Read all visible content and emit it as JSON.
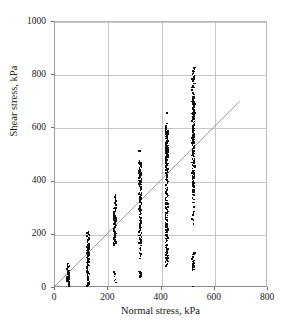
{
  "chart_data": {
    "type": "scatter",
    "title": "",
    "xlabel": "Normal stress, kPa",
    "ylabel": "Shear stress, kPa",
    "xlim": [
      0,
      800
    ],
    "ylim": [
      0,
      1000
    ],
    "xticks": [
      0,
      200,
      400,
      600,
      800
    ],
    "yticks": [
      0,
      200,
      400,
      600,
      800,
      1000
    ],
    "xtick_labels": [
      "0",
      "200",
      "400",
      "600",
      "800"
    ],
    "ytick_labels": [
      "0",
      "200",
      "400",
      "600",
      "800",
      "1000"
    ],
    "grid": true,
    "legend": false,
    "marker_color": "#111111",
    "grid_color": "#c6c6c6",
    "axis_color": "#8a8a8a",
    "trendline": {
      "name": "linear fit",
      "color": "#8e8e8e",
      "x_start": 0,
      "y_start": 0,
      "x_end": 700,
      "y_end": 700,
      "slope": 1.0,
      "intercept": 0
    },
    "series": [
      {
        "name": "Direct shear test results",
        "clusters": [
          {
            "x": 50,
            "y_min": 10,
            "y_max": 90,
            "values": [
              10,
              14,
              18,
              22,
              26,
              30,
              34,
              38,
              42,
              46,
              50,
              54,
              58,
              62,
              66,
              70,
              74,
              78,
              82,
              86,
              90,
              48,
              52,
              56,
              40,
              44,
              60,
              64,
              36,
              32
            ]
          },
          {
            "x": 125,
            "y_min": 5,
            "y_max": 212,
            "values": [
              5,
              12,
              20,
              28,
              35,
              42,
              50,
              58,
              65,
              72,
              80,
              88,
              95,
              100,
              105,
              110,
              115,
              120,
              124,
              128,
              132,
              136,
              140,
              144,
              148,
              152,
              156,
              160,
              164,
              168,
              172,
              176,
              180,
              184,
              188,
              192,
              196,
              200,
              204,
              208,
              212,
              130,
              134,
              138,
              142,
              146,
              150,
              154,
              158,
              162,
              118,
              122,
              126,
              112,
              108,
              102,
              96,
              90,
              84,
              76,
              68,
              60,
              54,
              46,
              38,
              30,
              22,
              16,
              10,
              8
            ]
          },
          {
            "x": 225,
            "y_min": 18,
            "y_max": 350,
            "values": [
              18,
              26,
              34,
              42,
              50,
              58,
              160,
              168,
              176,
              184,
              192,
              200,
              208,
              216,
              224,
              232,
              240,
              248,
              256,
              264,
              272,
              280,
              288,
              296,
              304,
              312,
              320,
              328,
              336,
              344,
              350,
              236,
              244,
              252,
              260,
              268,
              276,
              284,
              292,
              300,
              228,
              220,
              212,
              204,
              196,
              188,
              180,
              172,
              164,
              240,
              250,
              258,
              266,
              274,
              282,
              290,
              246,
              254,
              262,
              270
            ]
          },
          {
            "x": 320,
            "y_min": 38,
            "y_max": 515,
            "values": [
              38,
              44,
              50,
              56,
              62,
              120,
              150,
              170,
              185,
              195,
              205,
              215,
              225,
              235,
              245,
              255,
              265,
              275,
              285,
              295,
              305,
              315,
              325,
              335,
              345,
              355,
              365,
              375,
              385,
              390,
              395,
              400,
              405,
              410,
              415,
              420,
              425,
              430,
              435,
              440,
              445,
              450,
              455,
              460,
              465,
              470,
              478,
              515,
              398,
              402,
              406,
              412,
              418,
              424,
              408,
              414,
              422,
              428,
              434,
              396,
              392,
              388,
              380,
              370,
              360,
              350,
              340,
              330,
              320,
              310,
              300,
              290,
              280,
              270,
              260,
              250,
              240,
              230,
              220,
              210,
              200,
              190,
              180,
              168,
              158,
              140,
              130,
              110
            ]
          },
          {
            "x": 420,
            "y_min": 80,
            "y_max": 660,
            "values": [
              80,
              90,
              100,
              112,
              124,
              136,
              148,
              160,
              172,
              184,
              196,
              208,
              220,
              232,
              244,
              256,
              268,
              280,
              292,
              304,
              316,
              328,
              340,
              352,
              364,
              376,
              388,
              400,
              412,
              424,
              436,
              448,
              460,
              470,
              478,
              486,
              494,
              500,
              506,
              512,
              518,
              524,
              530,
              536,
              542,
              548,
              554,
              560,
              566,
              572,
              578,
              584,
              590,
              596,
              602,
              560,
              566,
              548,
              540,
              532,
              524,
              516,
              508,
              500,
              492,
              484,
              552,
              558,
              544,
              536,
              528,
              520,
              512,
              504,
              496,
              488,
              480,
              472,
              464,
              456,
              448,
              440,
              610,
              618,
              660,
              570,
              574,
              580,
              586,
              592,
              598,
              568,
              562,
              556,
              550,
              546,
              538,
              534,
              526,
              522,
              514,
              510,
              502,
              498,
              490,
              482,
              474,
              466,
              458,
              450,
              442,
              434,
              426,
              418,
              410,
              402,
              394,
              386,
              378,
              370,
              362,
              354,
              346,
              338,
              330,
              322,
              314,
              306,
              298,
              290,
              282,
              274,
              266,
              258,
              250,
              242,
              234,
              226,
              218,
              210,
              202,
              194,
              186,
              178,
              170,
              162,
              154,
              146,
              138,
              130,
              122,
              114,
              106,
              98,
              88
            ]
          },
          {
            "x": 520,
            "y_min": 5,
            "y_max": 830,
            "values": [
              5,
              70,
              78,
              86,
              94,
              102,
              110,
              118,
              126,
              132,
              92,
              84,
              76,
              240,
              285,
              330,
              360,
              380,
              395,
              410,
              425,
              440,
              455,
              470,
              485,
              500,
              515,
              530,
              545,
              560,
              575,
              590,
              600,
              608,
              616,
              624,
              632,
              640,
              648,
              656,
              664,
              672,
              680,
              688,
              696,
              704,
              712,
              720,
              728,
              736,
              744,
              752,
              760,
              768,
              776,
              784,
              792,
              800,
              806,
              812,
              818,
              824,
              830,
              660,
              668,
              676,
              684,
              692,
              700,
              708,
              716,
              652,
              644,
              636,
              628,
              620,
              612,
              604,
              596,
              588,
              580,
              572,
              564,
              556,
              548,
              540,
              532,
              524,
              516,
              508,
              496,
              480,
              464,
              448,
              432,
              416,
              400,
              384,
              368,
              352,
              336,
              320,
              304,
              288,
              272,
              256,
              674,
              682,
              690,
              698,
              706,
              714,
              722,
              666,
              658,
              650,
              642,
              634,
              626,
              618,
              610,
              602,
              594,
              586,
              578,
              570,
              562,
              554,
              546,
              538,
              530,
              522,
              514,
              506,
              498,
              490,
              482,
              474,
              466,
              458,
              450,
              442,
              434,
              426,
              418,
              410,
              402,
              394,
              386,
              378,
              370,
              362,
              354,
              346
            ]
          }
        ]
      }
    ]
  }
}
